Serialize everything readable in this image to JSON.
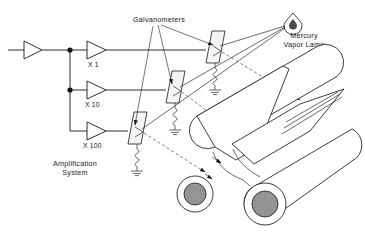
{
  "diagram": {
    "labels": {
      "galvanometers": "Galvanometers",
      "mercury_vapor_lamp_line1": "Mercury",
      "mercury_vapor_lamp_line2": "Vapor Lamp",
      "amplification_line1": "Amplification",
      "amplification_line2": "System",
      "gain_x1": "X 1",
      "gain_x10": "X 10",
      "gain_x100": "X 100"
    },
    "amplifiers": [
      {
        "name": "input-amplifier",
        "gain": ""
      },
      {
        "name": "amplifier-x1",
        "gain": "X 1"
      },
      {
        "name": "amplifier-x10",
        "gain": "X 10"
      },
      {
        "name": "amplifier-x100",
        "gain": "X 100"
      }
    ],
    "galvanometers": [
      {
        "name": "galvanometer-top",
        "channel": "X 1"
      },
      {
        "name": "galvanometer-middle",
        "channel": "X 10"
      },
      {
        "name": "galvanometer-bottom",
        "channel": "X 100"
      }
    ],
    "drums": [
      {
        "name": "drum-upper"
      },
      {
        "name": "drum-lower"
      }
    ],
    "colors": {
      "line": "#1a1a1a",
      "background": "#ffffff",
      "drum_core": "#8f8f8f",
      "mirror": "#f4f4f4"
    },
    "icons": {
      "lamp": "flame-icon",
      "ground": "ground-icon",
      "coil": "coil-icon",
      "junction": "junction-dot-icon"
    }
  }
}
